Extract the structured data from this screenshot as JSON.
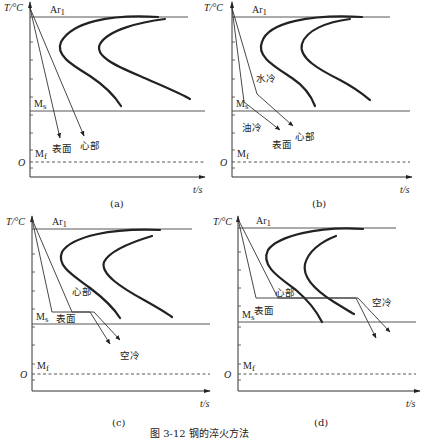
{
  "figure": {
    "caption": "图 3-12   钢的淬火方法",
    "axis": {
      "y_label": "T/°C",
      "x_label": "t/s",
      "origin": "O"
    },
    "lines": {
      "ar1": "Ar",
      "ar1_sub": "1",
      "ms": "M",
      "ms_sub": "s",
      "mf": "M",
      "mf_sub": "f"
    }
  },
  "panels": [
    {
      "id": "a",
      "label": "(a)",
      "annotations": {
        "surface": "表面",
        "core": "心部"
      }
    },
    {
      "id": "b",
      "label": "(b)",
      "annotations": {
        "water": "水冷",
        "oil": "油冷",
        "surface": "表面",
        "core": "心部"
      }
    },
    {
      "id": "c",
      "label": "(c)",
      "annotations": {
        "core": "心部",
        "surface": "表面",
        "air": "空冷"
      }
    },
    {
      "id": "d",
      "label": "(d)",
      "annotations": {
        "core": "心部",
        "surface": "表面",
        "air": "空冷"
      }
    }
  ]
}
